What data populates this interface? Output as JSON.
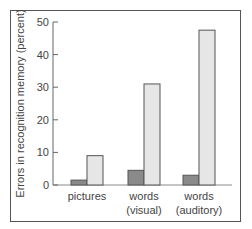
{
  "chart_data": {
    "type": "bar",
    "title": "",
    "xlabel": "",
    "ylabel": "Errors in recognition memory (percent)",
    "ylim": [
      0,
      50
    ],
    "yticks": [
      0,
      10,
      20,
      30,
      40,
      50
    ],
    "grid": false,
    "legend": null,
    "categories": [
      "pictures",
      "words (visual)",
      "words (auditory)"
    ],
    "category_lines": [
      [
        "pictures"
      ],
      [
        "words",
        "(visual)"
      ],
      [
        "words",
        "(auditory)"
      ]
    ],
    "series": [
      {
        "name": "series-dark",
        "color": "#8a8a8a",
        "values": [
          1.5,
          4.5,
          3
        ]
      },
      {
        "name": "series-light",
        "color": "#e6e6e6",
        "values": [
          9,
          31,
          47.5
        ]
      }
    ]
  }
}
